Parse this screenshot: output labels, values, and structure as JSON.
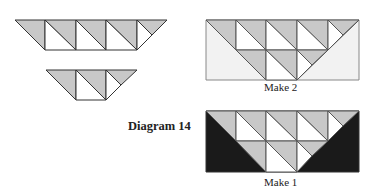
{
  "diagram": {
    "title": "Diagram 14",
    "colors": {
      "gray": "#c8c8c8",
      "white": "#ffffff",
      "dark": "#1a1a1a",
      "light_bg": "#f0f0f0",
      "line": "#333333"
    },
    "panels": [
      {
        "id": "strip-large",
        "label": ""
      },
      {
        "id": "strip-small",
        "label": ""
      },
      {
        "id": "make-2",
        "label": "Make 2"
      },
      {
        "id": "make-1",
        "label": "Make 1"
      }
    ]
  }
}
